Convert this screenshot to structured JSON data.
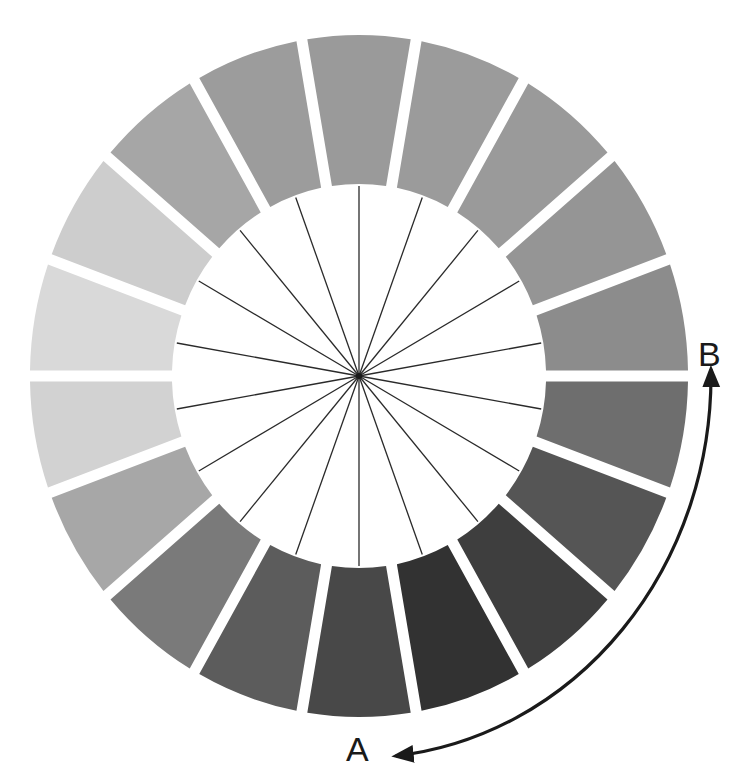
{
  "diagram": {
    "type": "value-wheel",
    "segment_count": 18,
    "segments": [
      {
        "index": 0,
        "angle_deg": 0,
        "color": "#9a9a9a"
      },
      {
        "index": 1,
        "angle_deg": 20,
        "color": "#9b9b9b"
      },
      {
        "index": 2,
        "angle_deg": 40,
        "color": "#9a9a9a"
      },
      {
        "index": 3,
        "angle_deg": 60,
        "color": "#959595"
      },
      {
        "index": 4,
        "angle_deg": 80,
        "color": "#8c8c8c"
      },
      {
        "index": 5,
        "angle_deg": 100,
        "color": "#6e6e6e"
      },
      {
        "index": 6,
        "angle_deg": 120,
        "color": "#555555"
      },
      {
        "index": 7,
        "angle_deg": 140,
        "color": "#3e3e3e"
      },
      {
        "index": 8,
        "angle_deg": 160,
        "color": "#323232"
      },
      {
        "index": 9,
        "angle_deg": 180,
        "color": "#484848"
      },
      {
        "index": 10,
        "angle_deg": 200,
        "color": "#5c5c5c"
      },
      {
        "index": 11,
        "angle_deg": 220,
        "color": "#7a7a7a"
      },
      {
        "index": 12,
        "angle_deg": 240,
        "color": "#a7a7a7"
      },
      {
        "index": 13,
        "angle_deg": 260,
        "color": "#d2d2d2"
      },
      {
        "index": 14,
        "angle_deg": 280,
        "color": "#d9d9d9"
      },
      {
        "index": 15,
        "angle_deg": 300,
        "color": "#cdcdcd"
      },
      {
        "index": 16,
        "angle_deg": 320,
        "color": "#a6a6a6"
      },
      {
        "index": 17,
        "angle_deg": 340,
        "color": "#9c9c9c"
      }
    ],
    "spoke_color": "#2a2a2a",
    "arrow_color": "#1a1a1a",
    "labels": {
      "a": "A",
      "b": "B"
    }
  }
}
